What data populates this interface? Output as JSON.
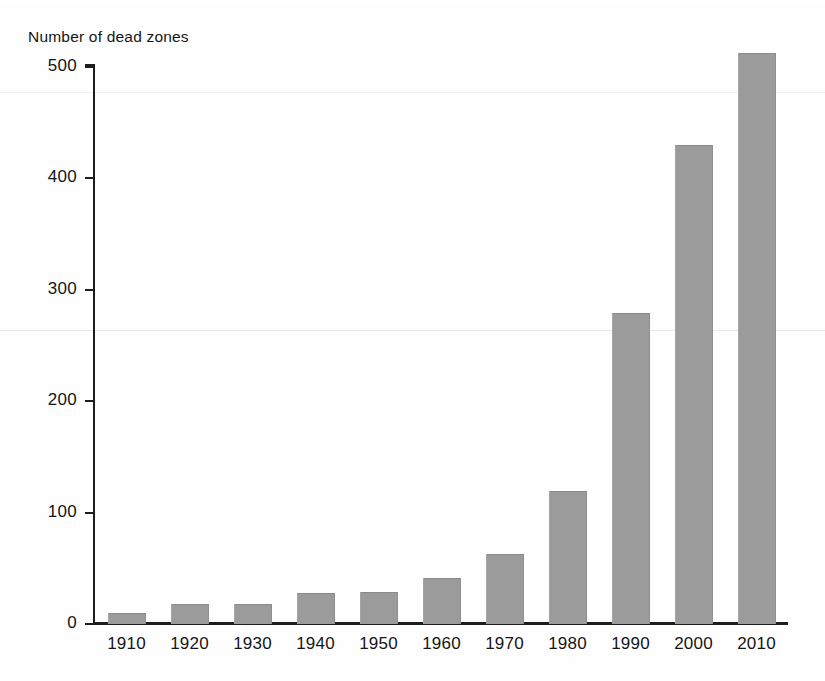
{
  "chart_data": {
    "type": "bar",
    "title": "Number of dead zones",
    "subtitle": "",
    "xlabel": "",
    "ylabel": "Number of dead zones",
    "categories": [
      "1910",
      "1920",
      "1930",
      "1940",
      "1950",
      "1960",
      "1970",
      "1980",
      "1990",
      "2000",
      "2010"
    ],
    "values": [
      10,
      18,
      18,
      28,
      29,
      41,
      63,
      119,
      279,
      430,
      513
    ],
    "ylim": [
      0,
      500
    ],
    "y_ticks": [
      0,
      100,
      200,
      300,
      400,
      500
    ],
    "y_tick_labels": [
      "0",
      "100",
      "200",
      "300",
      "400",
      "500"
    ],
    "grid": false,
    "legend": "none",
    "bar_color": "#9b9b9b",
    "axis_color": "#1d1d1d",
    "background_color": "#fefefe"
  },
  "figure": {
    "title": "Number of dead zones"
  }
}
